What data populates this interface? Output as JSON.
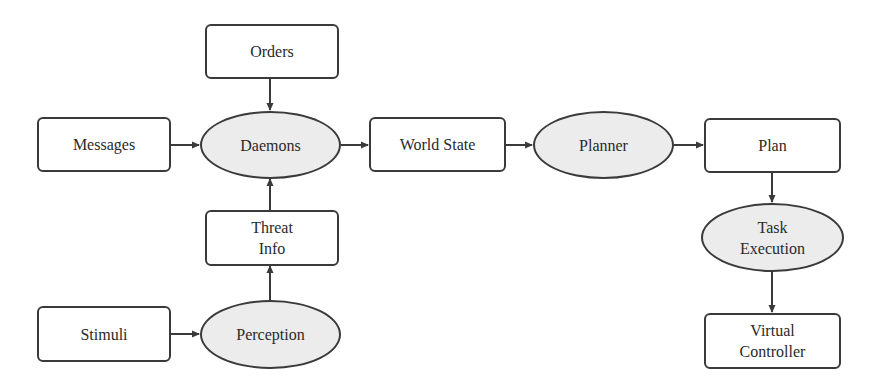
{
  "diagram": {
    "nodes": [
      {
        "id": "orders",
        "label": "Orders",
        "shape": "box",
        "x": 205,
        "y": 24,
        "w": 134,
        "h": 55
      },
      {
        "id": "messages",
        "label": "Messages",
        "shape": "box",
        "x": 37,
        "y": 117,
        "w": 134,
        "h": 55
      },
      {
        "id": "daemons",
        "label": "Daemons",
        "shape": "ellipse",
        "x": 200,
        "y": 111,
        "w": 141,
        "h": 68
      },
      {
        "id": "world_state",
        "label": "World State",
        "shape": "box",
        "x": 369,
        "y": 117,
        "w": 137,
        "h": 55
      },
      {
        "id": "planner",
        "label": "Planner",
        "shape": "ellipse",
        "x": 533,
        "y": 111,
        "w": 141,
        "h": 68
      },
      {
        "id": "plan",
        "label": "Plan",
        "shape": "box",
        "x": 704,
        "y": 118,
        "w": 137,
        "h": 55
      },
      {
        "id": "task_execution",
        "label": "Task\nExecution",
        "shape": "ellipse",
        "x": 701,
        "y": 203,
        "w": 143,
        "h": 69
      },
      {
        "id": "virtual_controller",
        "label": "Virtual\nController",
        "shape": "box",
        "x": 704,
        "y": 313,
        "w": 137,
        "h": 56
      },
      {
        "id": "threat_info",
        "label": "Threat\nInfo",
        "shape": "box",
        "x": 205,
        "y": 210,
        "w": 134,
        "h": 56
      },
      {
        "id": "stimuli",
        "label": "Stimuli",
        "shape": "box",
        "x": 37,
        "y": 306,
        "w": 134,
        "h": 56
      },
      {
        "id": "perception",
        "label": "Perception",
        "shape": "ellipse",
        "x": 200,
        "y": 300,
        "w": 141,
        "h": 69
      }
    ],
    "edges": [
      {
        "from": "orders",
        "to": "daemons",
        "x1": 270,
        "y1": 79,
        "x2": 270,
        "y2": 110
      },
      {
        "from": "messages",
        "to": "daemons",
        "x1": 171,
        "y1": 145,
        "x2": 199,
        "y2": 145
      },
      {
        "from": "threat_info",
        "to": "daemons",
        "x1": 270,
        "y1": 210,
        "x2": 270,
        "y2": 179
      },
      {
        "from": "daemons",
        "to": "world_state",
        "x1": 341,
        "y1": 145,
        "x2": 368,
        "y2": 145
      },
      {
        "from": "world_state",
        "to": "planner",
        "x1": 506,
        "y1": 145,
        "x2": 532,
        "y2": 145
      },
      {
        "from": "planner",
        "to": "plan",
        "x1": 674,
        "y1": 145,
        "x2": 703,
        "y2": 145
      },
      {
        "from": "plan",
        "to": "task_execution",
        "x1": 772,
        "y1": 173,
        "x2": 772,
        "y2": 202
      },
      {
        "from": "task_execution",
        "to": "virtual_controller",
        "x1": 772,
        "y1": 272,
        "x2": 772,
        "y2": 312
      },
      {
        "from": "perception",
        "to": "threat_info",
        "x1": 270,
        "y1": 300,
        "x2": 270,
        "y2": 266
      },
      {
        "from": "stimuli",
        "to": "perception",
        "x1": 171,
        "y1": 334,
        "x2": 199,
        "y2": 334
      }
    ],
    "colors": {
      "stroke": "#3a3a3a",
      "ellipse_fill": "#ececec",
      "box_fill": "#ffffff",
      "text": "#2a2a2a"
    }
  }
}
